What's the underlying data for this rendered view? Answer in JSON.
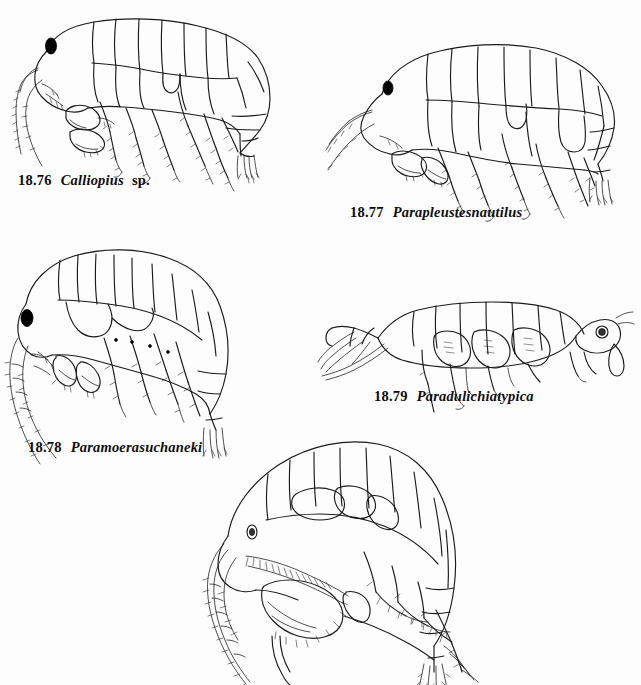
{
  "plate": {
    "background_color": "#fdfdfd",
    "ink_color": "#1a1a1a",
    "width": 641,
    "height": 685,
    "subject": "amphipod line drawings"
  },
  "figures": [
    {
      "id": "fig-18-76",
      "number": "18.76",
      "genus": "Calliopius",
      "epithet": "",
      "qualifier": "sp.",
      "caption_full": "18.76  Calliopius sp.",
      "orientation": "head-left",
      "eye_style": "solid-black"
    },
    {
      "id": "fig-18-77",
      "number": "18.77",
      "genus": "Parapleustes",
      "epithet": "nautilus",
      "qualifier": "",
      "caption_full": "18.77  Parapleustes nautilus",
      "orientation": "head-left",
      "eye_style": "solid-black"
    },
    {
      "id": "fig-18-78",
      "number": "18.78",
      "genus": "Paramoera",
      "epithet": "suchaneki",
      "qualifier": "",
      "caption_full": "18.78  Paramoera suchaneki",
      "orientation": "head-left",
      "eye_style": "solid-black"
    },
    {
      "id": "fig-18-79",
      "number": "18.79",
      "genus": "Paradulichia",
      "epithet": "typica",
      "qualifier": "",
      "caption_full": "18.79  Paradulichia typica",
      "orientation": "head-right",
      "eye_style": "open-circle"
    },
    {
      "id": "fig-bottom-unlabeled",
      "number": "",
      "genus": "",
      "epithet": "",
      "qualifier": "",
      "caption_full": "",
      "orientation": "head-left",
      "eye_style": "open-circle"
    }
  ]
}
